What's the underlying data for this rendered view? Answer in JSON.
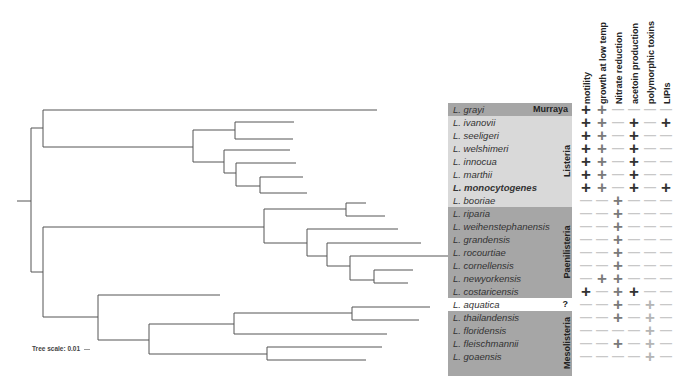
{
  "traits": [
    "motility",
    "growth at low temp",
    "Nitrate reduction",
    "acetoin production",
    "polymorphic toxins",
    "LIPIs"
  ],
  "groups": [
    {
      "name": "Murraya",
      "color": "#a6a6a6",
      "rows": [
        0,
        0
      ]
    },
    {
      "name": "Listeria",
      "color": "#d9d9d9",
      "rows": [
        1,
        7
      ]
    },
    {
      "name": "Paenilisteria",
      "color": "#a6a6a6",
      "rows": [
        8,
        14
      ]
    },
    {
      "name": "?",
      "color": "#ffffff",
      "rows": [
        15,
        15
      ]
    },
    {
      "name": "Mesolisteria",
      "color": "#a6a6a6",
      "rows": [
        16,
        20
      ]
    }
  ],
  "colors": {
    "plus_dark": "#333333",
    "plus_mid": "#7a7a7a",
    "plus_light": "#b5b5b5",
    "minus": "#c8c8c8",
    "tree_line": "#555555"
  },
  "species": [
    {
      "name": "L. grayi",
      "traits": [
        "+d",
        "+m",
        "-",
        "-",
        "-",
        "-"
      ]
    },
    {
      "name": "L. ivanovii",
      "traits": [
        "+d",
        "+m",
        "-",
        "+d",
        "-",
        "+d"
      ]
    },
    {
      "name": "L. seeligeri",
      "traits": [
        "+d",
        "+m",
        "-",
        "+d",
        "-",
        "-"
      ]
    },
    {
      "name": "L. welshimeri",
      "traits": [
        "+d",
        "+m",
        "-",
        "+d",
        "-",
        "-"
      ]
    },
    {
      "name": "L. innocua",
      "traits": [
        "+d",
        "+m",
        "-",
        "+d",
        "-",
        "-"
      ]
    },
    {
      "name": "L. marthii",
      "traits": [
        "+d",
        "+m",
        "-",
        "+d",
        "-",
        "-"
      ]
    },
    {
      "name": "L. monocytogenes",
      "traits": [
        "+d",
        "+m",
        "-",
        "+d",
        "-",
        "+d"
      ]
    },
    {
      "name": "L. booriae",
      "traits": [
        "-",
        "-",
        "+m",
        "-",
        "-",
        "-"
      ]
    },
    {
      "name": "L. riparia",
      "traits": [
        "-",
        "-",
        "+m",
        "-",
        "-",
        "-"
      ]
    },
    {
      "name": "L. weihenstephanensis",
      "traits": [
        "-",
        "-",
        "+m",
        "-",
        "-",
        "-"
      ]
    },
    {
      "name": "L. grandensis",
      "traits": [
        "-",
        "-",
        "+m",
        "-",
        "-",
        "-"
      ]
    },
    {
      "name": "L. rocourtiae",
      "traits": [
        "-",
        "-",
        "+m",
        "-",
        "-",
        "-"
      ]
    },
    {
      "name": "L. cornellensis",
      "traits": [
        "-",
        "-",
        "+m",
        "-",
        "-",
        "-"
      ]
    },
    {
      "name": "L. newyorkensis",
      "traits": [
        "-",
        "+m",
        "+m",
        "-",
        "-",
        "-"
      ]
    },
    {
      "name": "L. costaricensis",
      "traits": [
        "+d",
        "-",
        "+m",
        "+d",
        "-",
        "-"
      ]
    },
    {
      "name": "L. aquatica",
      "traits": [
        "-",
        "-",
        "+m",
        "-",
        "+l",
        "-"
      ]
    },
    {
      "name": "L. thailandensis",
      "traits": [
        "-",
        "-",
        "+m",
        "-",
        "+l",
        "-"
      ]
    },
    {
      "name": "L. floridensis",
      "traits": [
        "-",
        "-",
        "-",
        "-",
        "+l",
        "-"
      ]
    },
    {
      "name": "L. fleischmannii",
      "traits": [
        "-",
        "-",
        "+m",
        "-",
        "+l",
        "-"
      ]
    },
    {
      "name": "L. goaensis",
      "traits": [
        "-",
        "-",
        "-",
        "-",
        "+l",
        "-"
      ]
    }
  ],
  "scale": {
    "label": "Tree scale: 0.01"
  }
}
